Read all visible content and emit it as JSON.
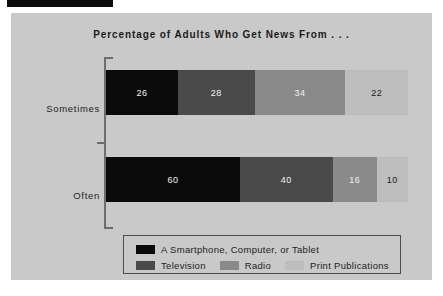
{
  "page": {
    "top_bar_color": "#0c0c0c",
    "panel_background": "#c9c9c9"
  },
  "chart_data": {
    "type": "bar",
    "orientation": "horizontal",
    "stacked": true,
    "normalized": true,
    "title": "Percentage of Adults Who Get News From . . .",
    "xlabel": "",
    "ylabel": "",
    "grid": false,
    "legend_position": "bottom",
    "categories": [
      "Sometimes",
      "Often"
    ],
    "series": [
      {
        "name": "A Smartphone, Computer, or Tablet",
        "color": "#0b0b0b",
        "values": [
          26,
          60
        ]
      },
      {
        "name": "Television",
        "color": "#4a4a4a",
        "values": [
          28,
          40
        ]
      },
      {
        "name": "Radio",
        "color": "#8a8a8a",
        "values": [
          34,
          16
        ]
      },
      {
        "name": "Print Publications",
        "color": "#bdbdbd",
        "values": [
          22,
          10
        ]
      }
    ],
    "bars": [
      {
        "category": "Sometimes",
        "segments": [
          {
            "series": "A Smartphone, Computer, or Tablet",
            "value": 26,
            "label": "26"
          },
          {
            "series": "Television",
            "value": 28,
            "label": "28"
          },
          {
            "series": "Radio",
            "value": 34,
            "label": "34"
          },
          {
            "series": "Print Publications",
            "value": 22,
            "label": "22"
          }
        ]
      },
      {
        "category": "Often",
        "segments": [
          {
            "series": "A Smartphone, Computer, or Tablet",
            "value": 60,
            "label": "60"
          },
          {
            "series": "Television",
            "value": 40,
            "label": "40"
          },
          {
            "series": "Radio",
            "value": 16,
            "label": "16"
          },
          {
            "series": "Print Publications",
            "value": 10,
            "label": "10"
          }
        ]
      }
    ]
  },
  "legend": {
    "row1": [
      {
        "label": "A Smartphone, Computer, or Tablet",
        "color": "#0b0b0b"
      }
    ],
    "row2": [
      {
        "label": "Television",
        "color": "#4a4a4a"
      },
      {
        "label": "Radio",
        "color": "#8a8a8a"
      },
      {
        "label": "Print Publications",
        "color": "#bdbdbd"
      }
    ]
  }
}
